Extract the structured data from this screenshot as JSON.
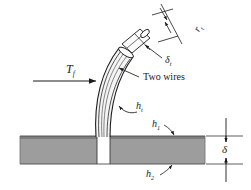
{
  "figure": {
    "type": "engineering-cross-section-diagram"
  },
  "labels": {
    "tube_radius": "r",
    "tube_radius_sub": "t",
    "tube_thickness": "δ",
    "tube_thickness_sub": "t",
    "tube_coefficient": "h",
    "tube_coefficient_sub": "t",
    "flow_temperature": "T",
    "flow_temperature_sub": "f",
    "top_coefficient": "h",
    "top_coefficient_sub": "1",
    "bottom_coefficient": "h",
    "bottom_coefficient_sub": "2",
    "slab_thickness": "δ",
    "two_wires": "Two wires"
  },
  "colors": {
    "slab_fill": "#9d9d9d",
    "slab_edge": "#6e6e6e",
    "line": "#1a1a1a",
    "background": "#ffffff",
    "tube_fill": "#f2f2f2"
  },
  "geometry": {
    "slab_left": 20,
    "slab_right": 205,
    "slab_top": 136,
    "slab_bottom": 164,
    "hole_left": 97,
    "hole_right": 110,
    "dimension_x": 226
  }
}
